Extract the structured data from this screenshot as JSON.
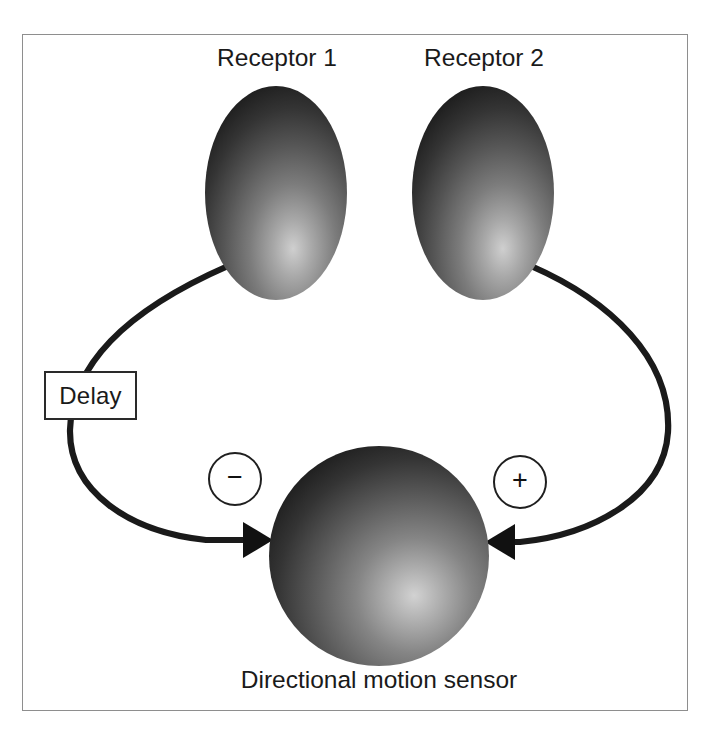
{
  "diagram": {
    "frame": {
      "border_color": "#8e8e8e"
    },
    "receptors": [
      {
        "id": "receptor-1",
        "label": "Receptor 1",
        "shape": "ellipse",
        "cx": 276,
        "cy": 193,
        "rx": 71,
        "ry": 107
      },
      {
        "id": "receptor-2",
        "label": "Receptor 2",
        "shape": "ellipse",
        "cx": 483,
        "cy": 193,
        "rx": 71,
        "ry": 107
      }
    ],
    "sensor": {
      "id": "sensor",
      "label": "Directional motion sensor",
      "shape": "circle",
      "cx": 379,
      "cy": 556,
      "r": 110
    },
    "delay": {
      "id": "delay",
      "label": "Delay",
      "shape": "rect"
    },
    "signs": [
      {
        "id": "inhibitory",
        "glyph": "−",
        "meaning": "minus"
      },
      {
        "id": "excitatory",
        "glyph": "+",
        "meaning": "plus"
      }
    ],
    "connections": [
      {
        "id": "left-pathway",
        "from": "receptor-1",
        "to": "sensor",
        "via": "delay",
        "sign": "−",
        "arrow": "right"
      },
      {
        "id": "right-pathway",
        "from": "receptor-2",
        "to": "sensor",
        "via": null,
        "sign": "+",
        "arrow": "left"
      }
    ],
    "colors": {
      "stroke": "#1a1a1a",
      "shape_dark": "#151515",
      "shape_mid": "#5c5c5c",
      "shape_light": "#c6c6c6",
      "background": "#ffffff"
    }
  }
}
